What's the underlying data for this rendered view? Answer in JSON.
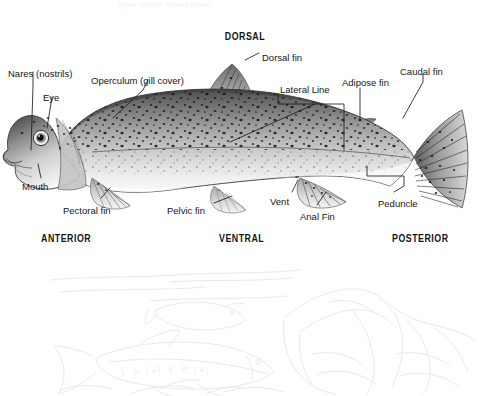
{
  "page": {
    "background_color": "#ffffff",
    "ink_color": "#161616",
    "sketch_color": "#e9e9e9"
  },
  "ghost_caption": {
    "line": "figure caption clipped above"
  },
  "orientation_labels": [
    {
      "key": "dorsal",
      "text": "DORSAL",
      "x": 222,
      "y": 31
    },
    {
      "key": "anterior",
      "text": "ANTERIOR",
      "x": 41,
      "y": 233
    },
    {
      "key": "ventral",
      "text": "VENTRAL",
      "x": 219,
      "y": 233
    },
    {
      "key": "posterior",
      "text": "POSTERIOR",
      "x": 392,
      "y": 233
    }
  ],
  "part_labels": [
    {
      "key": "nares",
      "text": "Nares (nostrils)",
      "x": 8,
      "y": 68
    },
    {
      "key": "eye",
      "text": "Eye",
      "x": 43,
      "y": 92
    },
    {
      "key": "operculum",
      "text": "Operculum (gill cover)",
      "x": 91,
      "y": 75
    },
    {
      "key": "dorsal_fin",
      "text": "Dorsal fin",
      "x": 262,
      "y": 52
    },
    {
      "key": "lateral",
      "text": "Lateral Line",
      "x": 280,
      "y": 84
    },
    {
      "key": "adipose",
      "text": "Adipose fin",
      "x": 342,
      "y": 77
    },
    {
      "key": "caudal",
      "text": "Caudal fin",
      "x": 400,
      "y": 66
    },
    {
      "key": "mouth",
      "text": "Mouth",
      "x": 22,
      "y": 181
    },
    {
      "key": "pectoral",
      "text": "Pectoral fin",
      "x": 63,
      "y": 205
    },
    {
      "key": "pelvic",
      "text": "Pelvic fin",
      "x": 167,
      "y": 205
    },
    {
      "key": "vent",
      "text": "Vent",
      "x": 270,
      "y": 196
    },
    {
      "key": "anal",
      "text": "Anal Fin",
      "x": 300,
      "y": 211
    },
    {
      "key": "peduncle",
      "text": "Peduncle",
      "x": 378,
      "y": 198
    }
  ],
  "sketch": {
    "caption": "faint pencil underwater scene with trout and river rocks"
  }
}
